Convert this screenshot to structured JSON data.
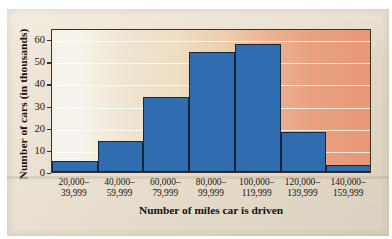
{
  "chart_data": {
    "type": "bar",
    "title": "",
    "xlabel": "Number of miles car is driven",
    "ylabel": "Number of cars (in thousands)",
    "categories": [
      "20,000–\n39,999",
      "40,000–\n59,999",
      "60,000–\n79,999",
      "80,000–\n99,999",
      "100,000–\n119,999",
      "120,000–\n139,999",
      "140,000–\n159,999"
    ],
    "category_lines": [
      [
        "20,000–",
        "39,999"
      ],
      [
        "40,000–",
        "59,999"
      ],
      [
        "60,000–",
        "79,999"
      ],
      [
        "80,000–",
        "99,999"
      ],
      [
        "100,000–",
        "119,999"
      ],
      [
        "120,000–",
        "139,999"
      ],
      [
        "140,000–",
        "159,999"
      ]
    ],
    "values": [
      5,
      14,
      34,
      54,
      58,
      18,
      3
    ],
    "ylim": [
      0,
      65
    ],
    "yticks": [
      0,
      10,
      20,
      30,
      40,
      50,
      60
    ],
    "ytick_labels": [
      "0",
      "10",
      "20",
      "30",
      "40",
      "50",
      "60"
    ],
    "grid": true,
    "legend": "none",
    "bar_color": "#2f6cb0",
    "bar_edge_color": "#17263a",
    "frame_color": "#3d2f22",
    "gridline_color": "#ffffff",
    "background_left_color": "#f6f2ea",
    "background_right_color": "#e79877",
    "page_color": "#ece2cf"
  }
}
